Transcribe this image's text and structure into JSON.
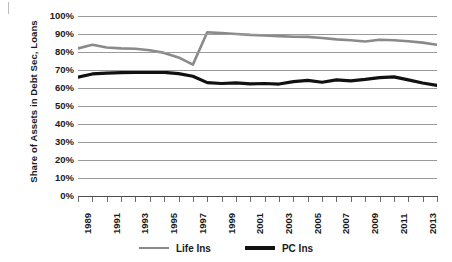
{
  "chart_data": {
    "type": "line",
    "title": "",
    "xlabel": "",
    "ylabel": "Share of Assets in Debt Sec, Loans",
    "ylim": [
      0,
      100
    ],
    "ytick_labels": [
      "100%",
      "90%",
      "80%",
      "70%",
      "60%",
      "50%",
      "40%",
      "30%",
      "20%",
      "10%",
      "0%"
    ],
    "ytick_values": [
      100,
      90,
      80,
      70,
      60,
      50,
      40,
      30,
      20,
      10,
      0
    ],
    "grid": true,
    "legend_position": "bottom",
    "x": [
      1989,
      1990,
      1991,
      1992,
      1993,
      1994,
      1995,
      1996,
      1997,
      1998,
      1999,
      2000,
      2001,
      2002,
      2003,
      2004,
      2005,
      2006,
      2007,
      2008,
      2009,
      2010,
      2011,
      2012,
      2013,
      2014
    ],
    "xtick_labels": [
      "1989",
      "1991",
      "1993",
      "1995",
      "1997",
      "1999",
      "2001",
      "2003",
      "2005",
      "2007",
      "2009",
      "2011",
      "2013"
    ],
    "xtick_values": [
      1989,
      1991,
      1993,
      1995,
      1997,
      1999,
      2001,
      2003,
      2005,
      2007,
      2009,
      2011,
      2013
    ],
    "series": [
      {
        "name": "Life Ins",
        "color": "#8a8a8a",
        "width": 2.6,
        "values": [
          82.0,
          84.0,
          82.5,
          82.0,
          81.8,
          81.0,
          79.5,
          77.0,
          73.0,
          91.0,
          90.5,
          90.0,
          89.5,
          89.2,
          88.8,
          88.5,
          88.4,
          87.8,
          87.0,
          86.5,
          85.8,
          86.8,
          86.5,
          86.0,
          85.2,
          84.0
        ]
      },
      {
        "name": "PC Ins",
        "color": "#111111",
        "width": 3.2,
        "values": [
          66.0,
          67.8,
          68.3,
          68.5,
          68.6,
          68.6,
          68.7,
          68.0,
          66.5,
          63.0,
          62.5,
          62.8,
          62.3,
          62.5,
          62.2,
          63.5,
          64.2,
          63.2,
          64.5,
          64.0,
          64.8,
          65.8,
          66.2,
          64.5,
          62.8,
          61.5
        ]
      }
    ]
  },
  "legend": {
    "items": [
      {
        "label": "Life Ins",
        "color": "#8a8a8a"
      },
      {
        "label": "PC Ins",
        "color": "#111111"
      }
    ]
  }
}
